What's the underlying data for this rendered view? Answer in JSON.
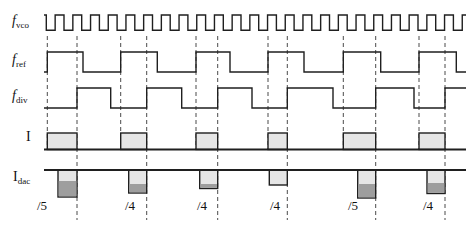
{
  "figure": {
    "width": 468,
    "height": 226,
    "background": "#ffffff"
  },
  "colors": {
    "line": "#1f1f1f",
    "pulse_fill_light": "#e6e6e6",
    "pulse_fill_dark": "#9e9e9e",
    "dash_line": "#4a4a4a",
    "text": "#111111"
  },
  "signals": [
    {
      "id": "vco",
      "main": "f",
      "sub": "vco",
      "italic": true,
      "x": 12,
      "y": 22
    },
    {
      "id": "ref",
      "main": "f",
      "sub": "ref",
      "italic": true,
      "x": 12,
      "y": 61
    },
    {
      "id": "div",
      "main": "f",
      "sub": "div",
      "italic": true,
      "x": 12,
      "y": 97
    },
    {
      "id": "i",
      "main": "I",
      "sub": "",
      "italic": false,
      "x": 26,
      "y": 138
    },
    {
      "id": "idac",
      "main": "I",
      "sub": "dac",
      "italic": false,
      "x": 13,
      "y": 178
    }
  ],
  "waveforms": {
    "x_start": 44,
    "x_end": 466,
    "vco": {
      "y_high": 15,
      "y_low": 30.3,
      "first_fall": 46.3,
      "half_period": 8.85
    },
    "ref": {
      "y_high": 52,
      "y_low": 72,
      "edges": [
        47.3,
        83,
        120.7,
        157.3,
        196,
        230,
        268,
        304,
        343.3,
        380.7,
        419,
        456.3
      ]
    },
    "div": {
      "y_high": 88,
      "y_low": 108,
      "edges": [
        77,
        110.7,
        146.7,
        181.7,
        217.7,
        252,
        287.3,
        333,
        375.7,
        414,
        445
      ]
    },
    "i": {
      "baseline_y": 149.5,
      "top_y": 133,
      "pulses": [
        [
          47.3,
          77
        ],
        [
          120.7,
          146.7
        ],
        [
          196,
          217.7
        ],
        [
          268,
          287.3
        ],
        [
          343.3,
          375.7
        ],
        [
          419,
          445
        ]
      ]
    },
    "idac": {
      "line_y": 170,
      "pulses": [
        {
          "x1": 58,
          "x2": 77,
          "mid": 181,
          "bottom": 197
        },
        {
          "x1": 128.7,
          "x2": 146.7,
          "mid": 184,
          "bottom": 193
        },
        {
          "x1": 199.7,
          "x2": 217.7,
          "mid": 184,
          "bottom": 188.5
        },
        {
          "x1": 269.3,
          "x2": 287.3,
          "mid": 185,
          "bottom": 185
        },
        {
          "x1": 357.7,
          "x2": 375.7,
          "mid": 184,
          "bottom": 198
        },
        {
          "x1": 427,
          "x2": 445,
          "mid": 183,
          "bottom": 193.5
        }
      ]
    }
  },
  "dashes": {
    "ref_x": [
      47.3,
      120.7,
      196,
      268,
      343.3,
      419
    ],
    "ref_y": [
      36,
      149.5
    ],
    "div_x": [
      77,
      146.7,
      217.7,
      287.3,
      375.7,
      445
    ],
    "div_y": [
      36,
      220
    ]
  },
  "cycle_labels": {
    "y": 205,
    "items": [
      {
        "text": "/5",
        "x": 42
      },
      {
        "text": "/4",
        "x": 130
      },
      {
        "text": "/4",
        "x": 202
      },
      {
        "text": "/4",
        "x": 275
      },
      {
        "text": "/5",
        "x": 353
      },
      {
        "text": "/4",
        "x": 428
      }
    ]
  }
}
